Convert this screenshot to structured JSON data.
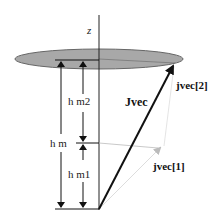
{
  "diagram": {
    "axis_label": "z",
    "labels": {
      "hm2": "h m2",
      "hm": "h m",
      "hm1": "h m1",
      "Jvec": "Jvec",
      "jvec2": "jvec[2]",
      "jvec1": "jvec[1]"
    },
    "colors": {
      "disk_fill": "#a8a8a8",
      "disk_stroke": "#555555",
      "line": "#111111",
      "light_line": "#c8c8c8"
    }
  }
}
